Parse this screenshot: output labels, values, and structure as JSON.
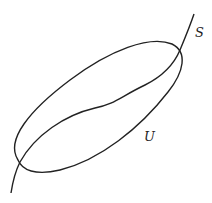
{
  "diagram": {
    "labels": {
      "curve": "S",
      "region": "U"
    },
    "elements": [
      {
        "id": "U",
        "type": "closed-curve",
        "shape": "tilted ellipse"
      },
      {
        "id": "S",
        "type": "open-curve",
        "description": "curve crossing U at two points"
      }
    ],
    "colors": {
      "stroke": "#222222",
      "background": "#ffffff"
    }
  }
}
